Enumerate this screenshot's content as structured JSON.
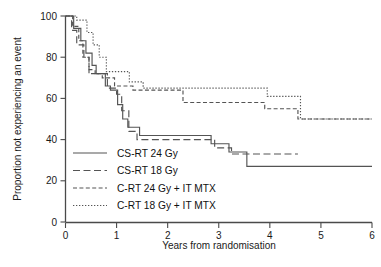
{
  "chart_data": {
    "type": "line",
    "title": "",
    "xlabel": "Years from randomisation",
    "ylabel": "Proportion not experiencing an event",
    "xlim": [
      0,
      6
    ],
    "ylim": [
      0,
      100
    ],
    "xticks": [
      "0",
      "1",
      "2",
      "3",
      "4",
      "5",
      "6"
    ],
    "yticks": [
      "0",
      "20",
      "40",
      "60",
      "80",
      "100"
    ],
    "grid": false,
    "legend_position": "lower-left-inside",
    "series": [
      {
        "name": "CS-RT 24 Gy",
        "style": "solid",
        "color": "#545454",
        "points": [
          [
            0.0,
            100
          ],
          [
            0.16,
            100
          ],
          [
            0.16,
            94
          ],
          [
            0.3,
            94
          ],
          [
            0.3,
            88
          ],
          [
            0.4,
            88
          ],
          [
            0.4,
            82
          ],
          [
            0.52,
            82
          ],
          [
            0.52,
            76
          ],
          [
            0.6,
            76
          ],
          [
            0.6,
            72
          ],
          [
            0.78,
            72
          ],
          [
            0.78,
            66
          ],
          [
            0.88,
            66
          ],
          [
            0.88,
            64
          ],
          [
            1.02,
            64
          ],
          [
            1.02,
            57
          ],
          [
            1.12,
            57
          ],
          [
            1.12,
            50
          ],
          [
            1.22,
            50
          ],
          [
            1.22,
            46
          ],
          [
            1.45,
            46
          ],
          [
            1.45,
            42
          ],
          [
            2.85,
            42
          ],
          [
            2.85,
            38
          ],
          [
            3.2,
            38
          ],
          [
            3.2,
            34
          ],
          [
            3.55,
            34
          ],
          [
            3.55,
            27
          ],
          [
            6.0,
            27
          ]
        ]
      },
      {
        "name": "CS-RT 18 Gy",
        "style": "longdash",
        "color": "#545454",
        "points": [
          [
            0.0,
            100
          ],
          [
            0.12,
            100
          ],
          [
            0.12,
            93
          ],
          [
            0.22,
            93
          ],
          [
            0.22,
            86
          ],
          [
            0.36,
            86
          ],
          [
            0.36,
            80
          ],
          [
            0.46,
            80
          ],
          [
            0.46,
            74
          ],
          [
            0.58,
            74
          ],
          [
            0.58,
            72
          ],
          [
            0.82,
            72
          ],
          [
            0.82,
            65
          ],
          [
            1.0,
            65
          ],
          [
            1.0,
            62
          ],
          [
            1.1,
            62
          ],
          [
            1.1,
            54
          ],
          [
            1.24,
            54
          ],
          [
            1.24,
            44
          ],
          [
            1.4,
            44
          ],
          [
            1.4,
            40
          ],
          [
            2.92,
            40
          ],
          [
            2.92,
            36
          ],
          [
            3.25,
            36
          ],
          [
            3.25,
            33
          ],
          [
            4.55,
            33
          ]
        ]
      },
      {
        "name": "C-RT 24 Gy + IT MTX",
        "style": "meddash",
        "color": "#545454",
        "points": [
          [
            0.0,
            100
          ],
          [
            0.14,
            100
          ],
          [
            0.14,
            95
          ],
          [
            0.26,
            95
          ],
          [
            0.26,
            88
          ],
          [
            0.34,
            88
          ],
          [
            0.34,
            80
          ],
          [
            0.46,
            80
          ],
          [
            0.46,
            72
          ],
          [
            0.72,
            72
          ],
          [
            0.72,
            70
          ],
          [
            0.96,
            70
          ],
          [
            0.96,
            66
          ],
          [
            1.32,
            66
          ],
          [
            1.32,
            64
          ],
          [
            2.3,
            64
          ],
          [
            2.3,
            58
          ],
          [
            3.9,
            58
          ],
          [
            3.9,
            55
          ],
          [
            4.55,
            55
          ],
          [
            4.55,
            50
          ],
          [
            6.0,
            50
          ]
        ]
      },
      {
        "name": "C-RT 18 Gy + IT MTX",
        "style": "dotted",
        "color": "#545454",
        "points": [
          [
            0.0,
            100
          ],
          [
            0.22,
            100
          ],
          [
            0.22,
            98
          ],
          [
            0.42,
            98
          ],
          [
            0.42,
            92
          ],
          [
            0.54,
            92
          ],
          [
            0.54,
            86
          ],
          [
            0.66,
            86
          ],
          [
            0.66,
            80
          ],
          [
            0.8,
            80
          ],
          [
            0.8,
            73
          ],
          [
            1.25,
            73
          ],
          [
            1.25,
            68
          ],
          [
            1.52,
            68
          ],
          [
            1.52,
            65
          ],
          [
            3.95,
            65
          ],
          [
            3.95,
            61
          ],
          [
            4.6,
            61
          ],
          [
            4.6,
            50
          ],
          [
            6.0,
            50
          ]
        ]
      }
    ]
  },
  "legend": {
    "items": [
      {
        "label": "CS-RT 24 Gy",
        "style": "solid"
      },
      {
        "label": "CS-RT 18 Gy",
        "style": "longdash"
      },
      {
        "label": "C-RT 24 Gy + IT MTX",
        "style": "meddash"
      },
      {
        "label": "C-RT 18 Gy + IT MTX",
        "style": "dotted"
      }
    ]
  }
}
